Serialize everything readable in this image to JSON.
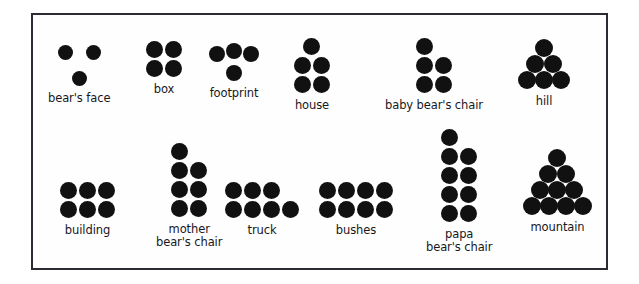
{
  "figure": {
    "background_color": "#ffffff",
    "border_color": "#2b2b33",
    "dot_color": "#111111",
    "label_color": "#17171c"
  },
  "groups": [
    {
      "id": "bears-face",
      "label": "bear's face",
      "count": 3,
      "arrangement": "2 over 1 centered",
      "spacing": "loose",
      "dot_diameter": 15,
      "dots": [
        {
          "x": 0,
          "y": 0
        },
        {
          "x": 28,
          "y": 0
        },
        {
          "x": 14,
          "y": 26
        }
      ],
      "x": 46,
      "y": 43
    },
    {
      "id": "box",
      "label": "box",
      "count": 4,
      "arrangement": "2 by 2 square",
      "spacing": "tight",
      "dot_diameter": 17,
      "dots": [
        {
          "x": 0,
          "y": 0
        },
        {
          "x": 19,
          "y": 0
        },
        {
          "x": 0,
          "y": 19
        },
        {
          "x": 19,
          "y": 19
        }
      ],
      "x": 144,
      "y": 39
    },
    {
      "id": "footprint",
      "label": "footprint",
      "count": 4,
      "arrangement": "3 on top, 1 below center-left",
      "spacing": "tight",
      "dot_diameter": 16,
      "dots": [
        {
          "x": 0,
          "y": 3
        },
        {
          "x": 17,
          "y": 0
        },
        {
          "x": 34,
          "y": 3
        },
        {
          "x": 17,
          "y": 22
        }
      ],
      "x": 207,
      "y": 41
    },
    {
      "id": "house",
      "label": "house",
      "count": 5,
      "arrangement": "1 top, 2 middle, 2 bottom",
      "spacing": "tight",
      "dot_diameter": 17,
      "dots": [
        {
          "x": 9,
          "y": 0
        },
        {
          "x": 0,
          "y": 19
        },
        {
          "x": 19,
          "y": 19
        },
        {
          "x": 0,
          "y": 38
        },
        {
          "x": 19,
          "y": 38
        }
      ],
      "x": 292,
      "y": 36
    },
    {
      "id": "baby-bears-chair",
      "label": "baby bear's chair",
      "count": 5,
      "arrangement": "1 top-left, 2 middle, 2 bottom",
      "spacing": "tight",
      "dot_diameter": 17,
      "dots": [
        {
          "x": 0,
          "y": 0
        },
        {
          "x": 0,
          "y": 19
        },
        {
          "x": 19,
          "y": 19
        },
        {
          "x": 0,
          "y": 38
        },
        {
          "x": 19,
          "y": 38
        }
      ],
      "x": 383,
      "y": 36
    },
    {
      "id": "hill",
      "label": "hill",
      "count": 6,
      "arrangement": "1 top, 2 middle, 3 bottom triangle",
      "spacing": "touching",
      "dot_diameter": 18,
      "dots": [
        {
          "x": 17,
          "y": 0
        },
        {
          "x": 8,
          "y": 16
        },
        {
          "x": 26,
          "y": 16
        },
        {
          "x": 0,
          "y": 32
        },
        {
          "x": 17,
          "y": 32
        },
        {
          "x": 34,
          "y": 32
        }
      ],
      "x": 516,
      "y": 37
    },
    {
      "id": "building",
      "label": "building",
      "count": 6,
      "arrangement": "3 by 2 rectangle",
      "spacing": "tight",
      "dot_diameter": 17,
      "dots": [
        {
          "x": 0,
          "y": 0
        },
        {
          "x": 19,
          "y": 0
        },
        {
          "x": 38,
          "y": 0
        },
        {
          "x": 0,
          "y": 19
        },
        {
          "x": 19,
          "y": 19
        },
        {
          "x": 38,
          "y": 19
        }
      ],
      "x": 58,
      "y": 180
    },
    {
      "id": "mother-bears-chair",
      "label": "mother\nbear's chair",
      "label_lines": [
        "mother",
        "bear's chair"
      ],
      "count": 7,
      "arrangement": "left column of 4, right column of 3 offset down",
      "spacing": "tight",
      "dot_diameter": 17,
      "dots": [
        {
          "x": 0,
          "y": 0
        },
        {
          "x": 0,
          "y": 19
        },
        {
          "x": 19,
          "y": 19
        },
        {
          "x": 0,
          "y": 38
        },
        {
          "x": 19,
          "y": 38
        },
        {
          "x": 0,
          "y": 57
        },
        {
          "x": 19,
          "y": 57
        }
      ],
      "x": 154,
      "y": 141
    },
    {
      "id": "truck",
      "label": "truck",
      "count": 7,
      "arrangement": "3 on top, 4 on bottom",
      "spacing": "tight",
      "dot_diameter": 17,
      "dots": [
        {
          "x": 0,
          "y": 0
        },
        {
          "x": 19,
          "y": 0
        },
        {
          "x": 38,
          "y": 0
        },
        {
          "x": 0,
          "y": 19
        },
        {
          "x": 19,
          "y": 19
        },
        {
          "x": 38,
          "y": 19
        },
        {
          "x": 57,
          "y": 19
        }
      ],
      "x": 223,
      "y": 180
    },
    {
      "id": "bushes",
      "label": "bushes",
      "count": 8,
      "arrangement": "4 by 2 rectangle",
      "spacing": "tight",
      "dot_diameter": 17,
      "dots": [
        {
          "x": 0,
          "y": 0
        },
        {
          "x": 19,
          "y": 0
        },
        {
          "x": 38,
          "y": 0
        },
        {
          "x": 57,
          "y": 0
        },
        {
          "x": 0,
          "y": 19
        },
        {
          "x": 19,
          "y": 19
        },
        {
          "x": 38,
          "y": 19
        },
        {
          "x": 57,
          "y": 19
        }
      ],
      "x": 317,
      "y": 180
    },
    {
      "id": "papa-bears-chair",
      "label": "papa\nbear's chair",
      "label_lines": [
        "papa",
        "bear's chair"
      ],
      "count": 9,
      "arrangement": "left column of 5, right column of 4 offset down",
      "spacing": "tight",
      "dot_diameter": 17,
      "dots": [
        {
          "x": 0,
          "y": 0
        },
        {
          "x": 0,
          "y": 19
        },
        {
          "x": 19,
          "y": 19
        },
        {
          "x": 0,
          "y": 38
        },
        {
          "x": 19,
          "y": 38
        },
        {
          "x": 0,
          "y": 57
        },
        {
          "x": 19,
          "y": 57
        },
        {
          "x": 0,
          "y": 76
        },
        {
          "x": 19,
          "y": 76
        }
      ],
      "x": 424,
      "y": 127
    },
    {
      "id": "mountain",
      "label": "mountain",
      "count": 10,
      "arrangement": "1, 2, 3, 4 triangular pyramid",
      "spacing": "touching",
      "dot_diameter": 18,
      "dots": [
        {
          "x": 25,
          "y": 0
        },
        {
          "x": 16,
          "y": 16
        },
        {
          "x": 34,
          "y": 16
        },
        {
          "x": 8,
          "y": 32
        },
        {
          "x": 25,
          "y": 32
        },
        {
          "x": 42,
          "y": 32
        },
        {
          "x": 0,
          "y": 48
        },
        {
          "x": 17,
          "y": 48
        },
        {
          "x": 34,
          "y": 48
        },
        {
          "x": 51,
          "y": 48
        }
      ],
      "x": 521,
      "y": 147
    }
  ]
}
